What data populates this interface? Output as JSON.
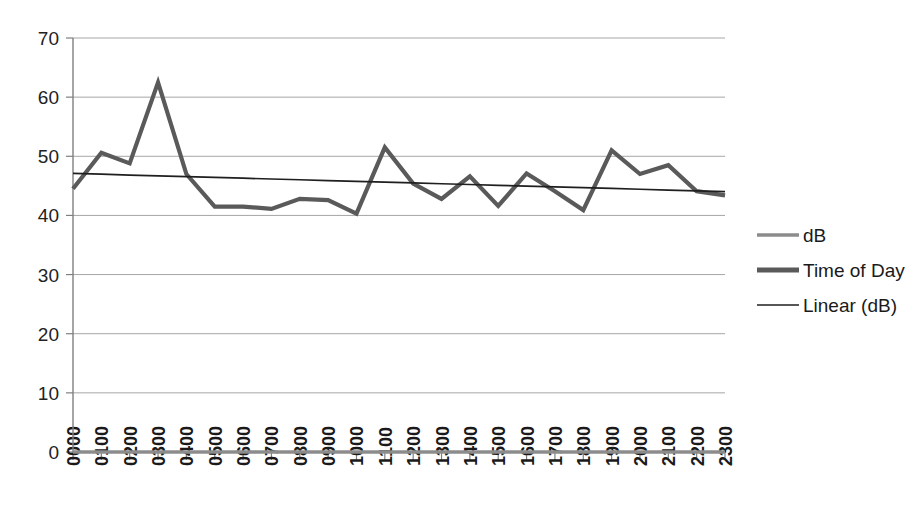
{
  "chart_data": {
    "type": "line",
    "title": "",
    "subtitle": "",
    "xlabel": "",
    "ylabel": "",
    "categories": [
      "0000",
      "0100",
      "0200",
      "0300",
      "0400",
      "0500",
      "0600",
      "0700",
      "0800",
      "0900",
      "1000",
      "1100",
      "1200",
      "1300",
      "1400",
      "1500",
      "1600",
      "1700",
      "1800",
      "1900",
      "2000",
      "2100",
      "2200",
      "2300"
    ],
    "ylim": [
      0,
      70
    ],
    "yticks": [
      0,
      10,
      20,
      30,
      40,
      50,
      60,
      70
    ],
    "ytick_labels": [
      "0",
      "10",
      "20",
      "30",
      "40",
      "50",
      "60",
      "70"
    ],
    "grid": "horizontal",
    "legend_position": "right",
    "series": [
      {
        "name": "dB",
        "style": "thin-gray-line",
        "color": "#8c8c8c",
        "values": [
          0,
          0,
          0,
          0,
          0,
          0,
          0,
          0,
          0,
          0,
          0,
          0,
          0,
          0,
          0,
          0,
          0,
          0,
          0,
          0,
          0,
          0,
          0,
          0
        ]
      },
      {
        "name": "Time of Day",
        "style": "thick-gray-line",
        "color": "#5a5a5a",
        "values": [
          44.5,
          50.6,
          48.8,
          62.5,
          47.0,
          41.5,
          41.5,
          41.1,
          42.8,
          42.6,
          40.3,
          51.5,
          45.4,
          42.8,
          46.6,
          41.6,
          47.1,
          44.1,
          40.9,
          51.0,
          47.0,
          48.5,
          44.1,
          43.4
        ]
      },
      {
        "name": "Linear (dB)",
        "style": "thin-black-trendline",
        "color": "#1f1f1f",
        "trend_start": 47.1,
        "trend_end": 44.0,
        "values": [
          47.1,
          46.97,
          46.83,
          46.7,
          46.57,
          46.43,
          46.3,
          46.16,
          46.03,
          45.9,
          45.76,
          45.63,
          45.5,
          45.36,
          45.23,
          45.09,
          44.96,
          44.83,
          44.69,
          44.56,
          44.43,
          44.29,
          44.16,
          44.02
        ]
      }
    ],
    "legend": [
      {
        "label": "dB",
        "marker": "thin-gray-line"
      },
      {
        "label": "Time of Day",
        "marker": "thick-gray-line"
      },
      {
        "label": "Linear (dB)",
        "marker": "thin-black-line"
      }
    ]
  }
}
